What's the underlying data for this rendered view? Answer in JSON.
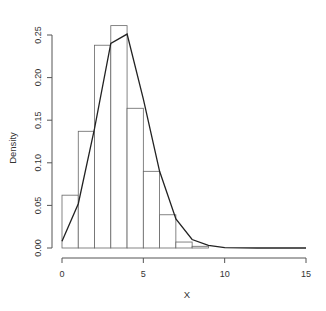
{
  "chart_data": {
    "type": "bar",
    "subtype": "histogram-with-density-line",
    "title": "",
    "xlabel": "X",
    "ylabel": "Density",
    "xlim": [
      0,
      15
    ],
    "ylim": [
      0,
      0.25
    ],
    "x_ticks": [
      0,
      5,
      10,
      15
    ],
    "y_ticks": [
      0.0,
      0.05,
      0.1,
      0.15,
      0.2,
      0.25
    ],
    "y_tick_labels": [
      "0.00",
      "0.05",
      "0.10",
      "0.15",
      "0.20",
      "0.25"
    ],
    "grid": false,
    "legend": null,
    "histogram": {
      "bin_edges": [
        0,
        1,
        2,
        3,
        4,
        5,
        6,
        7,
        8,
        9
      ],
      "density": [
        0.062,
        0.137,
        0.238,
        0.261,
        0.164,
        0.09,
        0.039,
        0.007,
        0.002
      ]
    },
    "line": {
      "x": [
        0,
        1,
        2,
        3,
        4,
        5,
        6,
        7,
        8,
        9,
        10,
        11,
        12,
        13,
        14,
        15
      ],
      "y": [
        0.008,
        0.052,
        0.14,
        0.24,
        0.251,
        0.175,
        0.09,
        0.034,
        0.01,
        0.003,
        0.0005,
        0.0001,
        0,
        0,
        0,
        0
      ]
    }
  },
  "colors": {
    "bar_fill": "#ffffff",
    "bar_stroke": "#666666",
    "line": "#222222",
    "axis": "#555555"
  }
}
